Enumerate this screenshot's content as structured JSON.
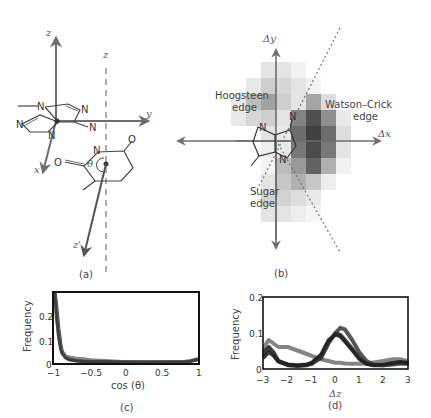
{
  "figure": {
    "panels": {
      "a": {
        "caption": "(a)",
        "axis_labels": {
          "z": "z",
          "z_dashed": "z",
          "y": "y",
          "x": "x",
          "z_prime": "z'"
        },
        "angle_label": "θ",
        "atoms": {
          "n1": "N",
          "n2": "N",
          "n3": "N",
          "n4": "N",
          "n5": "N",
          "n6": "N",
          "o1": "O",
          "o2": "O"
        }
      },
      "b": {
        "caption": "(b)",
        "axis_labels": {
          "dy": "Δy",
          "dx": "Δx"
        },
        "region_labels": {
          "hoogsteen_1": "Hoogsteen",
          "hoogsteen_2": "edge",
          "watson_1": "Watson–Crick",
          "watson_2": "edge",
          "sugar_1": "Sugar",
          "sugar_2": "edge"
        },
        "atoms": {
          "n1": "N",
          "n2": "N",
          "n3": "N"
        }
      },
      "c": {
        "caption": "(c)",
        "ylabel": "Frequency",
        "xlabel": "cos (θ)",
        "yticks": [
          "0",
          "0.1",
          "0.2"
        ],
        "xticks": [
          "−1",
          "−0.5",
          "0",
          "0.5",
          "1"
        ]
      },
      "d": {
        "caption": "(d)",
        "ylabel": "Frequency",
        "xlabel": "Δz",
        "yticks": [
          "0",
          "0.1",
          "0.2"
        ],
        "xticks": [
          "−3",
          "−2",
          "−1",
          "0",
          "1",
          "2",
          "3"
        ]
      }
    },
    "colors": {
      "axis_gray": "#707070",
      "dark_curve": "#1e1e1e",
      "mid_curve": "#3a3a3a",
      "light_curve": "#6e6e6e"
    }
  },
  "chart_data": [
    {
      "panel": "b",
      "type": "heatmap",
      "title": "",
      "xlabel": "Δx",
      "ylabel": "Δy",
      "annotations": [
        "Hoogsteen edge",
        "Watson–Crick edge",
        "Sugar edge"
      ],
      "note": "Grayscale 2D occupancy map around the base; darkest density on the Watson–Crick edge (right), lighter on Hoogsteen (upper-left) and Sugar (lower) edges; dotted line separates edges.",
      "grid_cols": 8,
      "grid_rows": 10,
      "values": [
        [
          0,
          0,
          0.12,
          0.12,
          0.06,
          0,
          0,
          0
        ],
        [
          0,
          0.1,
          0.22,
          0.18,
          0.12,
          0.06,
          0,
          0
        ],
        [
          0.1,
          0.3,
          0.42,
          0.22,
          0.12,
          0.4,
          0.15,
          0
        ],
        [
          0.1,
          0.18,
          0.22,
          0.12,
          0.55,
          0.78,
          0.5,
          0.1
        ],
        [
          0,
          0,
          0.12,
          0.1,
          0.65,
          0.85,
          0.65,
          0.15
        ],
        [
          0,
          0,
          0.08,
          0.1,
          0.6,
          0.8,
          0.6,
          0.12
        ],
        [
          0,
          0,
          0.05,
          0.3,
          0.45,
          0.7,
          0.35,
          0.06
        ],
        [
          0,
          0,
          0.12,
          0.25,
          0.35,
          0.25,
          0.08,
          0
        ],
        [
          0,
          0,
          0.2,
          0.2,
          0.15,
          0.1,
          0,
          0
        ],
        [
          0,
          0,
          0.12,
          0.12,
          0.08,
          0.04,
          0,
          0
        ]
      ]
    },
    {
      "panel": "c",
      "type": "line",
      "title": "",
      "xlabel": "cos (θ)",
      "ylabel": "Frequency",
      "xlim": [
        -1,
        1
      ],
      "ylim": [
        0,
        0.3
      ],
      "grid": false,
      "x": [
        -1.0,
        -0.98,
        -0.95,
        -0.92,
        -0.9,
        -0.85,
        -0.8,
        -0.7,
        -0.6,
        -0.5,
        -0.3,
        0,
        0.3,
        0.6,
        0.8,
        0.9,
        1.0
      ],
      "series": [
        {
          "name": "series 1",
          "values": [
            0.3,
            0.25,
            0.15,
            0.08,
            0.05,
            0.025,
            0.015,
            0.01,
            0.008,
            0.006,
            0.005,
            0.004,
            0.004,
            0.004,
            0.005,
            0.008,
            0.015
          ]
        },
        {
          "name": "series 2",
          "values": [
            0.3,
            0.22,
            0.13,
            0.07,
            0.045,
            0.03,
            0.025,
            0.02,
            0.018,
            0.013,
            0.01,
            0.005,
            0.004,
            0.004,
            0.005,
            0.009,
            0.018
          ]
        },
        {
          "name": "series 3",
          "values": [
            0.3,
            0.2,
            0.11,
            0.06,
            0.04,
            0.022,
            0.015,
            0.01,
            0.008,
            0.007,
            0.006,
            0.004,
            0.003,
            0.004,
            0.005,
            0.008,
            0.014
          ]
        }
      ]
    },
    {
      "panel": "d",
      "type": "line",
      "title": "",
      "xlabel": "Δz",
      "ylabel": "Frequency",
      "xlim": [
        -3,
        3
      ],
      "ylim": [
        0,
        0.2
      ],
      "grid": false,
      "x": [
        -3.0,
        -2.8,
        -2.6,
        -2.4,
        -2.0,
        -1.6,
        -1.2,
        -1.0,
        -0.6,
        -0.3,
        0.0,
        0.2,
        0.4,
        0.7,
        1.0,
        1.3,
        1.6,
        2.0,
        2.4,
        2.7,
        3.0
      ],
      "series": [
        {
          "name": "light gray",
          "values": [
            0.06,
            0.08,
            0.07,
            0.06,
            0.06,
            0.05,
            0.04,
            0.035,
            0.025,
            0.02,
            0.015,
            0.015,
            0.013,
            0.012,
            0.012,
            0.013,
            0.016,
            0.02,
            0.025,
            0.025,
            0.02
          ]
        },
        {
          "name": "dark 1",
          "values": [
            0.04,
            0.06,
            0.045,
            0.02,
            0.008,
            0.006,
            0.008,
            0.012,
            0.03,
            0.07,
            0.1,
            0.095,
            0.08,
            0.055,
            0.03,
            0.012,
            0.008,
            0.008,
            0.012,
            0.015,
            0.015
          ]
        },
        {
          "name": "dark 2",
          "values": [
            0.05,
            0.055,
            0.04,
            0.02,
            0.01,
            0.008,
            0.01,
            0.015,
            0.035,
            0.075,
            0.1,
            0.115,
            0.11,
            0.08,
            0.045,
            0.02,
            0.01,
            0.008,
            0.01,
            0.013,
            0.012
          ]
        },
        {
          "name": "mid gray",
          "values": [
            0.03,
            0.045,
            0.035,
            0.018,
            0.01,
            0.007,
            0.01,
            0.015,
            0.04,
            0.08,
            0.095,
            0.09,
            0.075,
            0.05,
            0.025,
            0.012,
            0.008,
            0.01,
            0.015,
            0.018,
            0.015
          ]
        }
      ]
    }
  ]
}
